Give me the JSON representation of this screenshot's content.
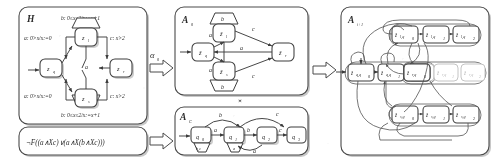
{
  "figure": {
    "domain": "diagram",
    "kind": "automaton-abstraction-refinement-pipeline",
    "background": "#ffffff",
    "ink_color": "#2b2b2b",
    "faint_color": "#b9b9b9"
  },
  "panels": {
    "hybrid_system": {
      "label": "H",
      "guards": {
        "top": "b: 0≤x≤2/x:=x+1",
        "bottom": "b: 0≤x≤2/x:=x+1",
        "left_upper": "a: 0>x/x:=0",
        "left_lower": "a: 0>x/x:=0",
        "right_upper": "c: x>2",
        "right_lower": "c: x>2",
        "center": "a"
      },
      "states": [
        {
          "id": "zq",
          "label": "z",
          "sub": "q",
          "initial": true
        },
        {
          "id": "zl",
          "label": "z",
          "sub": "l",
          "initial": false
        },
        {
          "id": "zr",
          "label": "z",
          "sub": "r",
          "initial": false
        },
        {
          "id": "zs",
          "label": "z",
          "sub": "s",
          "initial": false
        }
      ]
    },
    "formula": {
      "label": "ltl-property",
      "text": "¬F((a∧Xc)∨(a∧X(b∧Xc)))"
    },
    "abstraction": {
      "label": "A",
      "sub": "0",
      "states": [
        {
          "id": "zq0",
          "label": "ẑ",
          "sub": "q",
          "initial": true
        },
        {
          "id": "zl0",
          "label": "ẑ",
          "sub": "l",
          "initial": false
        },
        {
          "id": "zr0",
          "label": "ẑ",
          "sub": "r",
          "initial": false
        },
        {
          "id": "zs0",
          "label": "ẑ",
          "sub": "s",
          "initial": false
        }
      ],
      "edge_labels": [
        "a",
        "a",
        "b",
        "b",
        "c",
        "c",
        "a"
      ]
    },
    "product_symbol": "×",
    "buchi": {
      "label": "A",
      "sub": "C",
      "states": [
        {
          "id": "q0",
          "label": "q",
          "sub": "0",
          "initial": true,
          "accepting": true
        },
        {
          "id": "q1",
          "label": "q",
          "sub": "1",
          "initial": false,
          "accepting": true
        },
        {
          "id": "q2",
          "label": "q",
          "sub": "2",
          "initial": false,
          "accepting": true
        },
        {
          "id": "q3",
          "label": "q",
          "sub": "3",
          "initial": false,
          "accepting": false
        }
      ],
      "edge_labels": [
        "b,c",
        "a",
        "a",
        "b",
        "b",
        "a",
        "c",
        "c"
      ]
    },
    "refined": {
      "label": "A",
      "sub": "i+1",
      "groups": [
        {
          "id": "group-zl",
          "nodes": [
            {
              "label": "ẑ",
              "sub": "l,q",
              "sub2": "0",
              "faint": false
            },
            {
              "label": "ẑ",
              "sub": "l,q",
              "sub2": "1",
              "faint": false
            },
            {
              "label": "ẑ",
              "sub": "l,q",
              "sub2": "2",
              "faint": false
            }
          ]
        },
        {
          "id": "group-zq",
          "nodes": [
            {
              "label": "ẑ",
              "sub": "q,q",
              "sub2": "0",
              "faint": false,
              "initial": true
            },
            {
              "label": "ẑ",
              "sub": "q,q",
              "sub2": "1",
              "faint": false
            },
            {
              "label": "ẑ",
              "sub": "q,q",
              "sub2": "2",
              "faint": true
            }
          ]
        },
        {
          "id": "group-zr",
          "nodes": [
            {
              "label": "ẑ",
              "sub": "r,q",
              "sub2": "0",
              "faint": false
            },
            {
              "label": "ẑ",
              "sub": "r,q",
              "sub2": "1",
              "faint": true
            },
            {
              "label": "ẑ",
              "sub": "r,q",
              "sub2": "2",
              "faint": true
            }
          ]
        },
        {
          "id": "group-zs",
          "nodes": [
            {
              "label": "ẑ",
              "sub": "s,q",
              "sub2": "0",
              "faint": false
            },
            {
              "label": "ẑ",
              "sub": "s,q",
              "sub2": "1",
              "faint": false
            },
            {
              "label": "ẑ",
              "sub": "s,q",
              "sub2": "2",
              "faint": false
            }
          ]
        }
      ]
    }
  },
  "connectors": [
    {
      "id": "alpha-arrow",
      "label": "α",
      "sub": "0",
      "from": "hybrid_system",
      "to": "abstraction"
    },
    {
      "id": "formula-arrow",
      "label": "",
      "from": "formula",
      "to": "buchi"
    },
    {
      "id": "product-arrow",
      "label": "",
      "from": "product",
      "to": "refined"
    }
  ]
}
